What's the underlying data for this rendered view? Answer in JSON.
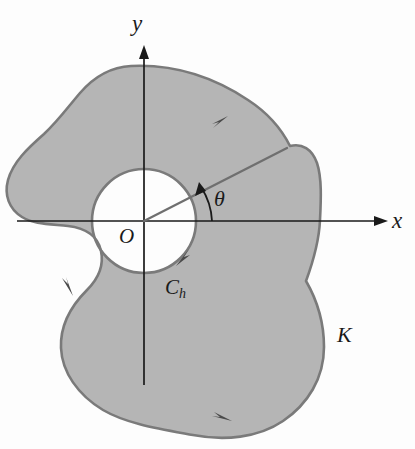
{
  "figure": {
    "type": "math-diagram",
    "background_color": "#fdfdfd",
    "region_fill_color": "#b5b5b5",
    "curve_stroke_color": "#7a7a7a",
    "axis_stroke_color": "#1a1a1a",
    "labels": {
      "y_axis": "y",
      "x_axis": "x",
      "origin": "O",
      "angle": "θ",
      "region": "K",
      "hole_curve_base": "C",
      "hole_curve_sub": "h"
    },
    "geometry": {
      "origin_px": [
        144,
        221
      ],
      "hole_radius_px": 52,
      "ray_angle_deg": 38,
      "ray_end_px": [
        287,
        148
      ],
      "x_axis_arrow_tip_px": [
        388,
        221
      ],
      "y_axis_arrow_tip_px": [
        144,
        45
      ]
    },
    "orientation_arrows": [
      {
        "name": "outer-top-arrow",
        "at_px": [
          222,
          121
        ],
        "direction": "counterclockwise-up-right"
      },
      {
        "name": "outer-left-arrow",
        "at_px": [
          70,
          287
        ],
        "direction": "counterclockwise-down"
      },
      {
        "name": "outer-bottom-arrow",
        "at_px": [
          223,
          419
        ],
        "direction": "counterclockwise-right"
      },
      {
        "name": "hole-arrow",
        "at_px": [
          182,
          258
        ],
        "direction": "clockwise-down-left"
      }
    ]
  }
}
